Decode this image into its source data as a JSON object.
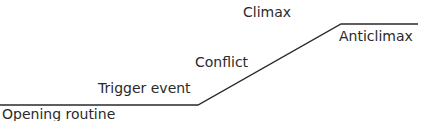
{
  "diagram": {
    "labels": {
      "opening_routine": "Opening routine",
      "trigger_event": "Trigger event",
      "conflict": "Conflict",
      "climax": "Climax",
      "anticlimax": "Anticlimax"
    },
    "line_color": "#2a2a2a"
  }
}
